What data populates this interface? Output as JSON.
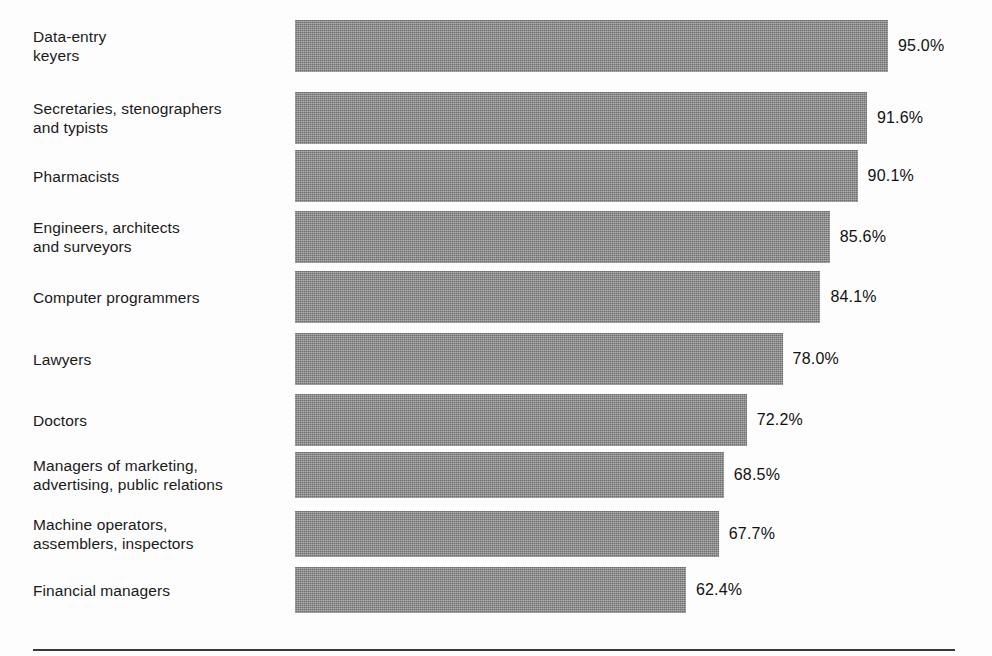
{
  "chart_data": {
    "type": "bar",
    "orientation": "horizontal",
    "title": "",
    "subtitle": "",
    "xlabel": "",
    "ylabel": "",
    "xlim": [
      0,
      100
    ],
    "grid": false,
    "legend": null,
    "value_suffix": "%",
    "categories": [
      "Data-entry\nkeyers",
      "Secretaries, stenographers\nand typists",
      "Pharmacists",
      "Engineers, architects\nand surveyors",
      "Computer programmers",
      "Lawyers",
      "Doctors",
      "Managers of marketing,\nadvertising, public relations",
      "Machine operators,\nassemblers, inspectors",
      "Financial managers"
    ],
    "values": [
      95.0,
      91.6,
      90.1,
      85.6,
      84.1,
      78.0,
      72.2,
      68.5,
      67.7,
      62.4
    ],
    "value_labels": [
      "95.0%",
      "91.6%",
      "90.1%",
      "85.6%",
      "84.1%",
      "78.0%",
      "72.2%",
      "68.5%",
      "67.7%",
      "62.4%"
    ],
    "bar_color": "#878787",
    "text_color": "#111111",
    "background_color": "#fdfdfd",
    "rule_color": "#3a3a3a"
  },
  "layout": {
    "bar_origin_x": 295,
    "px_per_unit": 6.2,
    "bar_base_px": 4,
    "value_gap_px": 10,
    "rows": [
      {
        "top": 20,
        "height": 52
      },
      {
        "top": 92,
        "height": 52
      },
      {
        "top": 150,
        "height": 52
      },
      {
        "top": 211,
        "height": 52
      },
      {
        "top": 271,
        "height": 52
      },
      {
        "top": 333,
        "height": 52
      },
      {
        "top": 394,
        "height": 52
      },
      {
        "top": 452,
        "height": 46
      },
      {
        "top": 511,
        "height": 46
      },
      {
        "top": 567,
        "height": 46
      }
    ],
    "rule": {
      "left": 33,
      "top": 649,
      "width": 922,
      "height": 2
    }
  }
}
